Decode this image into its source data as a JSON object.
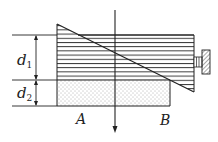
{
  "diagram": {
    "type": "optics-wedge-setup",
    "labels": {
      "d1_main": "d",
      "d1_sub": "1",
      "d2_main": "d",
      "d2_sub": "2",
      "point_a": "A",
      "point_b": "B"
    },
    "colors": {
      "stroke": "#222222",
      "background": "#ffffff",
      "dots": "#555555"
    },
    "components": [
      {
        "name": "upper-hatched-block",
        "pattern": "horizontal-lines"
      },
      {
        "name": "wedge-diagonal",
        "description": "inclined surface from top-left to bottom-right"
      },
      {
        "name": "lower-dotted-block",
        "pattern": "dots"
      },
      {
        "name": "vertical-light-ray",
        "direction": "down"
      },
      {
        "name": "adjusting-screw",
        "position": "right"
      },
      {
        "name": "dimension-d1"
      },
      {
        "name": "dimension-d2"
      }
    ]
  }
}
